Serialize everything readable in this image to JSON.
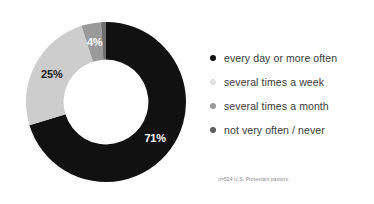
{
  "chart_data": {
    "type": "pie",
    "variant": "donut",
    "title": "",
    "subtitle": "",
    "xlabel": "",
    "ylabel": "",
    "grid": false,
    "legend_position": "right",
    "start_angle_deg": 0,
    "direction": "clockwise",
    "inner_radius_ratio": 0.53,
    "categories": [
      "every day or more often",
      "several times a week",
      "several times a month",
      "not very often / never"
    ],
    "values": [
      71,
      25,
      4,
      1
    ],
    "value_labels": [
      "71%",
      "25%",
      "4%",
      "1%"
    ],
    "colors": [
      "#111111",
      "#cdcdcd",
      "#9a9a9a",
      "#6e6e6e"
    ],
    "label_text_colors": [
      "#ffffff",
      "#1a1a1a",
      "#ffffff",
      "#1a1a1a"
    ],
    "annotations": [
      "n=524 U.S. Protestant pastors."
    ],
    "units": "percent",
    "total": 101
  },
  "donut": {
    "slices": [
      {
        "label": "71%",
        "value": 71,
        "color": "#111111",
        "text_color": "#ffffff"
      },
      {
        "label": "25%",
        "value": 25,
        "color": "#cdcdcd",
        "text_color": "#1a1a1a"
      },
      {
        "label": "4%",
        "value": 4,
        "color": "#9a9a9a",
        "text_color": "#ffffff"
      },
      {
        "label": "1%",
        "value": 1,
        "color": "#6e6e6e",
        "text_color": "#1a1a1a"
      }
    ]
  },
  "legend": {
    "items": [
      {
        "label": "every day or more often",
        "color": "#111111"
      },
      {
        "label": "several times a week",
        "color": "#e2e2e2"
      },
      {
        "label": "several times a month",
        "color": "#9a9a9a"
      },
      {
        "label": "not very often / never",
        "color": "#5e5e5e"
      }
    ]
  },
  "footnote": {
    "text": "n=524 U.S. Protestant pastors."
  }
}
